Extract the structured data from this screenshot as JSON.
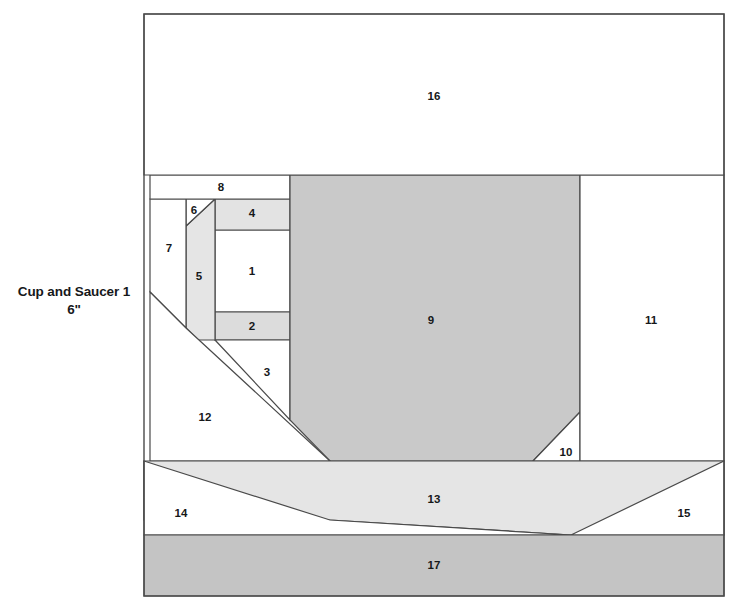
{
  "pattern": {
    "name": "Cup and Saucer 1",
    "size": "6\"",
    "label_lines": [
      "Cup and Saucer 1",
      "6\""
    ]
  },
  "colors": {
    "background": "#ffffff",
    "outline": "#4a4a4a",
    "fabric_light": "#ffffff",
    "fabric_pale": "#e9e9e9",
    "fabric_medium": "#dcdcdc",
    "fabric_mid": "#c9c9c9",
    "fabric_dark": "#c2c2c2"
  },
  "block": {
    "x": 144,
    "y": 14,
    "width": 580,
    "height": 582
  },
  "pieces": [
    {
      "id": "1",
      "label": "1",
      "fill": "#ffffff",
      "label_x": 252,
      "label_y": 272,
      "points": "215,230 290,230 290,312 215,312"
    },
    {
      "id": "2",
      "label": "2",
      "fill": "#dcdcdc",
      "label_x": 252,
      "label_y": 327,
      "points": "215,312 290,312 290,340 215,340"
    },
    {
      "id": "3",
      "label": "3",
      "fill": "#ffffff",
      "label_x": 267,
      "label_y": 373,
      "points": "215,340 290,340 290,420 215,340"
    },
    {
      "id": "4",
      "label": "4",
      "fill": "#e3e3e3",
      "label_x": 252,
      "label_y": 214,
      "points": "215,199 290,199 290,230 215,230"
    },
    {
      "id": "5",
      "label": "5",
      "fill": "#e5e5e5",
      "label_x": 199,
      "label_y": 277,
      "points": "186,226 215,199 215,340 198,340 186,328"
    },
    {
      "id": "6",
      "label": "6",
      "fill": "#ffffff",
      "label_x": 194,
      "label_y": 211,
      "points": "186,199 215,199 186,226"
    },
    {
      "id": "7",
      "label": "7",
      "fill": "#ffffff",
      "label_x": 169,
      "label_y": 249,
      "points": "150,199 186,199 186,328 150,292"
    },
    {
      "id": "8",
      "label": "8",
      "fill": "#ffffff",
      "label_x": 221,
      "label_y": 188,
      "points": "150,175 290,175 290,199 150,199"
    },
    {
      "id": "9",
      "label": "9",
      "fill": "#c9c9c9",
      "label_x": 431,
      "label_y": 321,
      "points": "290,175 580,175 580,412 533,461 330,461 290,420"
    },
    {
      "id": "10",
      "label": "10",
      "fill": "#ffffff",
      "label_x": 566,
      "label_y": 453,
      "points": "580,412 580,461 533,461"
    },
    {
      "id": "11",
      "label": "11",
      "fill": "#ffffff",
      "label_x": 651,
      "label_y": 321,
      "points": "580,175 724,175 724,461 580,461"
    },
    {
      "id": "12",
      "label": "12",
      "fill": "#ffffff",
      "label_x": 205,
      "label_y": 418,
      "points": "150,292 186,328 330,461 150,461"
    },
    {
      "id": "13",
      "label": "13",
      "fill": "#e5e5e5",
      "label_x": 434,
      "label_y": 500,
      "points": "144,461 724,461 724,535 571,535 330,520 144,520"
    },
    {
      "id": "14",
      "label": "14",
      "fill": "#ffffff",
      "label_x": 181,
      "label_y": 514,
      "points": "144,461 330,520 571,535 144,535"
    },
    {
      "id": "15",
      "label": "15",
      "fill": "#ffffff",
      "label_x": 684,
      "label_y": 514,
      "points": "724,461 724,535 571,535"
    },
    {
      "id": "16",
      "label": "16",
      "fill": "#ffffff",
      "label_x": 434,
      "label_y": 97,
      "points": "144,14 724,14 724,175 144,175"
    },
    {
      "id": "17",
      "label": "17",
      "fill": "#c4c4c4",
      "label_x": 434,
      "label_y": 566,
      "points": "144,535 724,535 724,596 144,596"
    }
  ]
}
